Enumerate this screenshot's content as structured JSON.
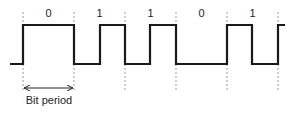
{
  "diagram": {
    "type": "manchester-encoding-waveform",
    "bits": [
      "0",
      "1",
      "1",
      "0",
      "1"
    ],
    "bit_period_label": "Bit period",
    "colors": {
      "signal": "#1a1a1a",
      "dashed": "#9a9a9a",
      "text": "#222222"
    }
  }
}
